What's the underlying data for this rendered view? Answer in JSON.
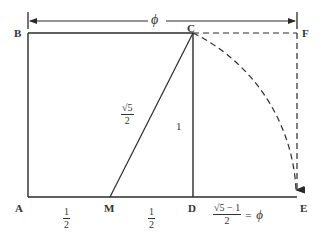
{
  "diagram": {
    "type": "golden-ratio-construction",
    "points": {
      "A": "A",
      "B": "B",
      "C": "C",
      "D": "D",
      "E": "E",
      "F": "F",
      "M": "M"
    },
    "top_dimension": "ϕ",
    "labels": {
      "AM": {
        "num": "1",
        "den": "2"
      },
      "MD": {
        "num": "1",
        "den": "2"
      },
      "MC": {
        "num": "√5",
        "den": "2"
      },
      "CD": "1",
      "DE": {
        "num": "√5 − 1",
        "den": "2",
        "equals": "=",
        "result": "ϕ"
      }
    },
    "colors": {
      "line": "#2a2a2a",
      "background": "#ffffff"
    }
  }
}
